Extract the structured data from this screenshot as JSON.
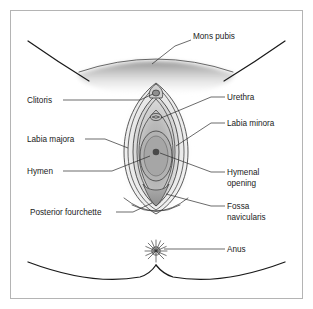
{
  "figure": {
    "background_color": "#ffffff",
    "border_color": "#b4b4b4",
    "line_color": "#1a1a1a",
    "leader_color": "#2b2b2b",
    "text_color": "#1a1a1a",
    "shading": {
      "outer_tissue": "#ececec",
      "mid_tissue": "#d2d2d2",
      "inner_tissue": "#b8b8b8",
      "deep_tissue": "#a4a4a4",
      "mons_shade": "#9a9a9a",
      "opening_dot": "#4a4a4a"
    }
  },
  "labels": [
    {
      "id": "mons-pubis",
      "text": "Mons pubis",
      "lines": [
        "Mons pubis"
      ],
      "side": "top",
      "text_x": 193,
      "text_y": 39,
      "anchor": "start"
    },
    {
      "id": "clitoris",
      "text": "Clitoris",
      "lines": [
        "Clitoris"
      ],
      "side": "left",
      "text_x": 27,
      "text_y": 103,
      "anchor": "start"
    },
    {
      "id": "labia-majora",
      "text": "Labia majora",
      "lines": [
        "Labia majora"
      ],
      "side": "left",
      "text_x": 27,
      "text_y": 142,
      "anchor": "start"
    },
    {
      "id": "hymen",
      "text": "Hymen",
      "lines": [
        "Hymen"
      ],
      "side": "left",
      "text_x": 27,
      "text_y": 174,
      "anchor": "start"
    },
    {
      "id": "posterior-fourchette",
      "text": "Posterior fourchette",
      "lines": [
        "Posterior fourchette"
      ],
      "side": "left",
      "text_x": 30,
      "text_y": 215,
      "anchor": "start"
    },
    {
      "id": "urethra",
      "text": "Urethra",
      "lines": [
        "Urethra"
      ],
      "side": "right",
      "text_x": 227,
      "text_y": 100,
      "anchor": "start"
    },
    {
      "id": "labia-minora",
      "text": "Labia minora",
      "lines": [
        "Labia minora"
      ],
      "side": "right",
      "text_x": 227,
      "text_y": 126,
      "anchor": "start"
    },
    {
      "id": "hymenal-opening",
      "text": "Hymenal opening",
      "lines": [
        "Hymenal",
        "opening"
      ],
      "side": "right",
      "text_x": 227,
      "text_y": 175,
      "anchor": "start"
    },
    {
      "id": "fossa-navicularis",
      "text": "Fossa navicularis",
      "lines": [
        "Fossa",
        "navicularis"
      ],
      "side": "right",
      "text_x": 227,
      "text_y": 209,
      "anchor": "start"
    },
    {
      "id": "anus",
      "text": "Anus",
      "lines": [
        "Anus"
      ],
      "side": "right",
      "text_x": 227,
      "text_y": 252,
      "anchor": "start"
    }
  ]
}
